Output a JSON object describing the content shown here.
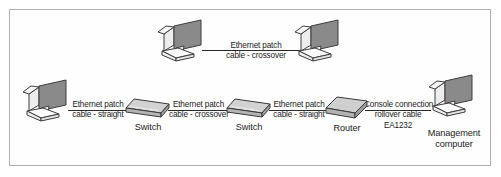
{
  "diagram": {
    "type": "network-topology",
    "colors": {
      "frame_border": "#b0b0b0",
      "background": "#ffffff",
      "cable_line": "#2a2a2a",
      "screen_fill": "#8a8a8a",
      "device_fill": "#c9c9c9",
      "device_outline": "#3a3a3a",
      "text": "#1c1c1c"
    },
    "nodes": [
      {
        "id": "pc-top-left",
        "icon": "computer-icon",
        "label": ""
      },
      {
        "id": "pc-top-right",
        "icon": "computer-icon",
        "label": ""
      },
      {
        "id": "pc-left",
        "icon": "computer-icon",
        "label": ""
      },
      {
        "id": "switch-1",
        "icon": "switch-icon",
        "label": "Switch"
      },
      {
        "id": "switch-2",
        "icon": "switch-icon",
        "label": "Switch"
      },
      {
        "id": "router-1",
        "icon": "router-icon",
        "label": "Router"
      },
      {
        "id": "pc-management",
        "icon": "computer-icon",
        "label_line1": "Management",
        "label_line2": "computer"
      }
    ],
    "links": [
      {
        "id": "link-top-crossover",
        "from": "pc-top-left",
        "to": "pc-top-right",
        "line1": "Ethernet patch",
        "line2": "cable - crossover"
      },
      {
        "id": "link-pc-to-switch1",
        "from": "pc-left",
        "to": "switch-1",
        "line1": "Ethernet patch",
        "line2": "cable - straight"
      },
      {
        "id": "link-switch1-to-switch2",
        "from": "switch-1",
        "to": "switch-2",
        "line1": "Ethernet patch",
        "line2": "cable - crossover"
      },
      {
        "id": "link-switch2-to-router",
        "from": "switch-2",
        "to": "router-1",
        "line1": "Ethernet patch",
        "line2": "cable - straight"
      },
      {
        "id": "link-router-to-management",
        "from": "router-1",
        "to": "pc-management",
        "line1": "Console connection",
        "line2": "rollover cable",
        "line3": "EA1232"
      }
    ]
  }
}
